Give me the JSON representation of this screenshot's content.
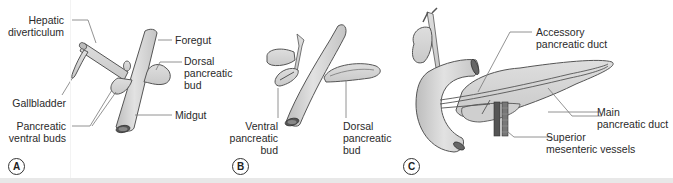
{
  "figure": {
    "panels": [
      {
        "id": "A",
        "letter": "A",
        "labels": {
          "hepatic_diverticulum": [
            "Hepatic",
            "diverticulum"
          ],
          "foregut": "Foregut",
          "dorsal_pancreatic_bud": [
            "Dorsal",
            "pancreatic",
            "bud"
          ],
          "gallbladder": "Gallbladder",
          "midgut": "Midgut",
          "pancreatic_ventral_buds": [
            "Pancreatic",
            "ventral buds"
          ]
        }
      },
      {
        "id": "B",
        "letter": "B",
        "labels": {
          "ventral_pancreatic_bud": [
            "Ventral",
            "pancreatic",
            "bud"
          ],
          "dorsal_pancreatic_bud": [
            "Dorsal",
            "pancreatic",
            "bud"
          ]
        }
      },
      {
        "id": "C",
        "letter": "C",
        "labels": {
          "accessory_pancreatic_duct": [
            "Accessory",
            "pancreatic duct"
          ],
          "main_pancreatic_duct": [
            "Main",
            "pancreatic duct"
          ],
          "superior_mesenteric_vessels": [
            "Superior",
            "mesenteric vessels"
          ]
        }
      }
    ],
    "colors": {
      "tissue_fill": "#d4d4d4",
      "tissue_stroke": "#555555",
      "leader_line": "#777777",
      "text": "#2a2a2a",
      "vessel": "#5a5a5a"
    }
  }
}
